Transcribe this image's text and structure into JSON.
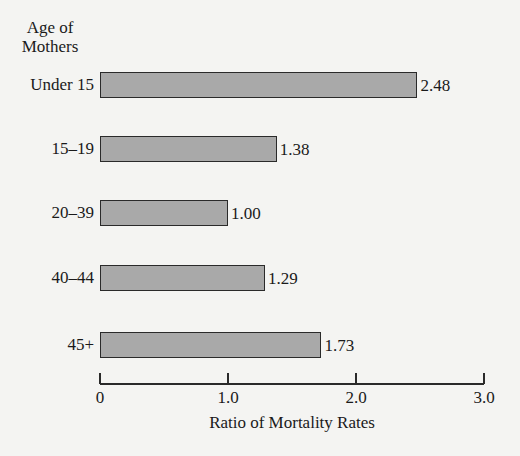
{
  "chart_data": {
    "type": "bar",
    "orientation": "horizontal",
    "title": "",
    "ylabel": "Age of Mothers",
    "xlabel": "Ratio of Mortality Rates",
    "categories": [
      "Under 15",
      "15–19",
      "20–39",
      "40–44",
      "45+"
    ],
    "values": [
      2.48,
      1.38,
      1.0,
      1.29,
      1.73
    ],
    "value_labels": [
      "2.48",
      "1.38",
      "1.00",
      "1.29",
      "1.73"
    ],
    "xlim": [
      0,
      3.0
    ],
    "xticks": [
      0,
      1.0,
      2.0,
      3.0
    ],
    "xtick_labels": [
      "0",
      "1.0",
      "2.0",
      "3.0"
    ],
    "grid": false,
    "legend": null,
    "bar_color": "#a9a9a9",
    "bar_edge_color": "#2a2a2a"
  },
  "labels": {
    "ylabel_line1": "Age of",
    "ylabel_line2": "Mothers"
  }
}
